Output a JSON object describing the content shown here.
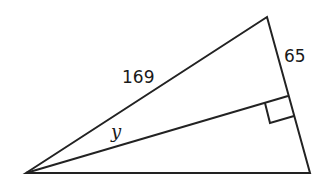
{
  "diagram": {
    "type": "right triangle with altitude",
    "labels": {
      "hypotenuse_side": "169",
      "short_side": "65",
      "angle_variable": "y"
    },
    "stroke_color": "#222222",
    "background": "#ffffff"
  }
}
